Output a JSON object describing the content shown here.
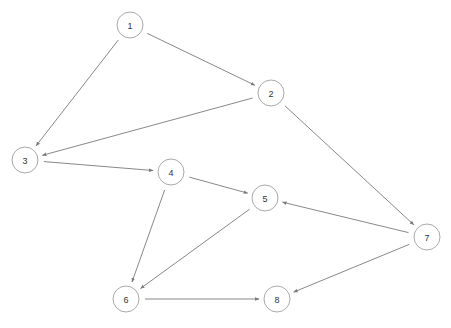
{
  "diagram": {
    "type": "directed-graph",
    "style": {
      "background": "#ffffff",
      "edge_color": "#7a7a7a",
      "node_stroke": "#aaaaaa",
      "node_fill": "#ffffff",
      "label_color": "#333333",
      "node_radius": 13
    },
    "nodes": [
      {
        "id": "1",
        "label": "1",
        "x": 130,
        "y": 25
      },
      {
        "id": "2",
        "label": "2",
        "x": 271,
        "y": 93
      },
      {
        "id": "3",
        "label": "3",
        "x": 25,
        "y": 160
      },
      {
        "id": "4",
        "label": "4",
        "x": 171,
        "y": 172
      },
      {
        "id": "5",
        "label": "5",
        "x": 265,
        "y": 198
      },
      {
        "id": "6",
        "label": "6",
        "x": 126,
        "y": 299
      },
      {
        "id": "7",
        "label": "7",
        "x": 427,
        "y": 237
      },
      {
        "id": "8",
        "label": "8",
        "x": 277,
        "y": 299
      }
    ],
    "edges": [
      {
        "from": "1",
        "to": "2"
      },
      {
        "from": "1",
        "to": "3"
      },
      {
        "from": "2",
        "to": "3"
      },
      {
        "from": "2",
        "to": "7"
      },
      {
        "from": "3",
        "to": "4"
      },
      {
        "from": "4",
        "to": "5"
      },
      {
        "from": "4",
        "to": "6"
      },
      {
        "from": "5",
        "to": "6"
      },
      {
        "from": "7",
        "to": "5"
      },
      {
        "from": "7",
        "to": "8"
      },
      {
        "from": "6",
        "to": "8"
      }
    ]
  }
}
